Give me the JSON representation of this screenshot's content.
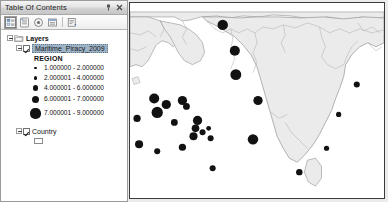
{
  "panel": {
    "title": "Table Of Contents",
    "pin_label": "\u0001",
    "close_label": "×",
    "buttons": {
      "pin": "auto-hide-pin",
      "close": "close"
    },
    "toolbar": [
      {
        "name": "list-by-drawing-order",
        "tooltip": "List By Drawing Order",
        "active": true
      },
      {
        "name": "list-by-source",
        "tooltip": "List By Source",
        "active": false
      },
      {
        "name": "list-by-visibility",
        "tooltip": "List By Visibility",
        "active": false
      },
      {
        "name": "list-by-selection",
        "tooltip": "List By Selection",
        "active": false
      },
      {
        "name": "options",
        "tooltip": "Options",
        "active": false
      }
    ]
  },
  "tree": {
    "root_label": "Layers",
    "layers": [
      {
        "label": "Maritime_Piracy_2009",
        "checked": true,
        "selected": true,
        "field_label": "REGION",
        "classes": [
          {
            "range": "1.000000 - 2.000000",
            "size": 2.2
          },
          {
            "range": "2.000001 - 4.000000",
            "size": 3.8
          },
          {
            "range": "4.000001 - 6.000000",
            "size": 5.6
          },
          {
            "range": "6.000001 - 7.000000",
            "size": 7.8
          },
          {
            "range": "7.000001 - 9.000000",
            "size": 10.2
          }
        ]
      },
      {
        "label": "Country",
        "checked": true,
        "selected": false,
        "swatch": "polygon-white"
      }
    ]
  },
  "map": {
    "land_fill": "#ebebeb",
    "land_stroke": "#a0a0a0",
    "ocean_fill": "#ffffff",
    "symbol_color": "#121212",
    "frame_color": "#3c3c3c",
    "points": [
      {
        "x": 92,
        "y": 22,
        "r": 5.2
      },
      {
        "x": 104,
        "y": 48,
        "r": 5.0
      },
      {
        "x": 105,
        "y": 72,
        "r": 5.4
      },
      {
        "x": 24,
        "y": 96,
        "r": 5.0
      },
      {
        "x": 36,
        "y": 102,
        "r": 4.6
      },
      {
        "x": 27,
        "y": 110,
        "r": 5.6
      },
      {
        "x": 52,
        "y": 98,
        "r": 4.6
      },
      {
        "x": 56,
        "y": 104,
        "r": 3.4
      },
      {
        "x": 7,
        "y": 116,
        "r": 3.6
      },
      {
        "x": 67,
        "y": 118,
        "r": 4.6
      },
      {
        "x": 65,
        "y": 126,
        "r": 3.8
      },
      {
        "x": 63,
        "y": 134,
        "r": 4.0
      },
      {
        "x": 72,
        "y": 130,
        "r": 3.0
      },
      {
        "x": 78,
        "y": 126,
        "r": 2.4
      },
      {
        "x": 80,
        "y": 136,
        "r": 3.0
      },
      {
        "x": 44,
        "y": 120,
        "r": 3.4
      },
      {
        "x": 9,
        "y": 142,
        "r": 4.0
      },
      {
        "x": 27,
        "y": 149,
        "r": 3.0
      },
      {
        "x": 52,
        "y": 145,
        "r": 3.6
      },
      {
        "x": 82,
        "y": 166,
        "r": 3.0
      },
      {
        "x": 122,
        "y": 137,
        "r": 5.2
      },
      {
        "x": 127,
        "y": 98,
        "r": 4.6
      },
      {
        "x": 195,
        "y": 146,
        "r": 2.6
      },
      {
        "x": 225,
        "y": 82,
        "r": 3.0
      },
      {
        "x": 207,
        "y": 112,
        "r": 2.6
      },
      {
        "x": 168,
        "y": 170,
        "r": 3.2
      }
    ]
  }
}
